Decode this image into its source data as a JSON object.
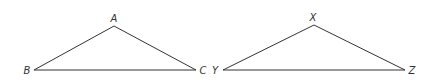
{
  "diagram": {
    "title": "",
    "stroke_color": "#333333",
    "background": "#ffffff",
    "triangles": [
      {
        "name": "ABC",
        "vertices": [
          {
            "label": "A",
            "x": 114,
            "y": 26,
            "lx": 114,
            "ly": 22
          },
          {
            "label": "B",
            "x": 34,
            "y": 70,
            "lx": 27,
            "ly": 74
          },
          {
            "label": "C",
            "x": 196,
            "y": 70,
            "lx": 203,
            "ly": 74
          }
        ]
      },
      {
        "name": "XYZ",
        "vertices": [
          {
            "label": "X",
            "x": 314,
            "y": 25,
            "lx": 313,
            "ly": 21
          },
          {
            "label": "Y",
            "x": 223,
            "y": 70,
            "lx": 215,
            "ly": 74
          },
          {
            "label": "Z",
            "x": 405,
            "y": 70,
            "lx": 412,
            "ly": 74
          }
        ]
      }
    ]
  }
}
